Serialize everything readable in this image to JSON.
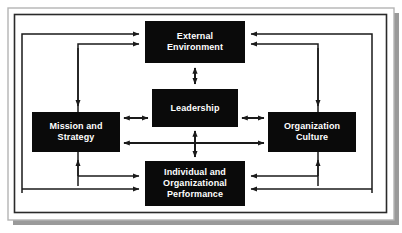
{
  "figure": {
    "type": "organizational-model-diagram",
    "frame": {
      "outer_border_color": "#b4b4b4",
      "inner_border_color": "#2a2a2a",
      "shadow_color": "#9a9a9a",
      "background": "#ffffff"
    },
    "style": {
      "box_fill": "#0a0a0a",
      "box_text_color": "#ffffff",
      "connector_color": "#1a1a1a"
    }
  },
  "boxes": [
    {
      "id": "external-environment",
      "label": "External\nEnvironment",
      "x": 145,
      "y": 21,
      "width": 100,
      "height": 42
    },
    {
      "id": "leadership",
      "label": "Leadership",
      "x": 152,
      "y": 89,
      "width": 86,
      "height": 38
    },
    {
      "id": "mission-and-strategy",
      "label": "Mission and\nStrategy",
      "x": 32,
      "y": 112,
      "width": 88,
      "height": 40
    },
    {
      "id": "organization-culture",
      "label": "Organization\nCulture",
      "x": 268,
      "y": 112,
      "width": 88,
      "height": 40
    },
    {
      "id": "individual-and-organizational-performance",
      "label": "Individual and\nOrganizational\nPerformance",
      "x": 145,
      "y": 161,
      "width": 100,
      "height": 45
    }
  ],
  "connectors": [
    {
      "id": "external-to-leadership",
      "kind": "double-vertical"
    },
    {
      "id": "leadership-to-performance",
      "kind": "double-vertical"
    },
    {
      "id": "mission-to-leadership",
      "kind": "double-horizontal-short"
    },
    {
      "id": "leadership-to-culture",
      "kind": "double-horizontal-short"
    },
    {
      "id": "mission-to-culture",
      "kind": "double-horizontal-long"
    },
    {
      "id": "outer-left-loop-to-external",
      "kind": "routed-arrow"
    },
    {
      "id": "mission-loop-to-external",
      "kind": "routed-arrow"
    },
    {
      "id": "outer-right-loop-to-external",
      "kind": "routed-arrow"
    },
    {
      "id": "culture-loop-to-external",
      "kind": "routed-arrow"
    },
    {
      "id": "outer-left-loop-to-performance",
      "kind": "routed-arrow"
    },
    {
      "id": "mission-loop-to-performance",
      "kind": "routed-arrow"
    },
    {
      "id": "outer-right-loop-to-performance",
      "kind": "routed-arrow"
    },
    {
      "id": "culture-loop-to-performance",
      "kind": "routed-arrow"
    }
  ]
}
